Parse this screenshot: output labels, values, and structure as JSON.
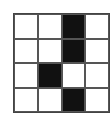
{
  "grid": {
    "rows": 4,
    "cols": 4,
    "fill_color": "#111111",
    "empty_color": "#ffffff",
    "line_color": "#555555",
    "cells": [
      [
        0,
        0,
        1,
        0
      ],
      [
        0,
        0,
        1,
        0
      ],
      [
        0,
        1,
        0,
        0
      ],
      [
        0,
        0,
        1,
        0
      ]
    ]
  }
}
